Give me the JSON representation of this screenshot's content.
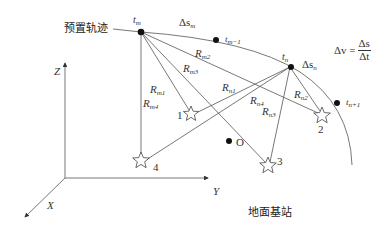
{
  "diagram": {
    "trajectory_label": "预置轨迹",
    "ground_station_label": "地面基站",
    "axes": {
      "x": "X",
      "y": "Y",
      "z": "Z"
    },
    "points": {
      "t_m": {
        "base": "t",
        "sub": "m"
      },
      "t_m_minus_1": {
        "base": "t",
        "sub": "m−1"
      },
      "t_n": {
        "base": "t",
        "sub": "n"
      },
      "t_n_plus_1": {
        "base": "t",
        "sub": "n+1"
      },
      "origin": "O"
    },
    "segments": {
      "ds_m": {
        "base": "Δs",
        "sub": "m"
      },
      "ds_n": {
        "base": "Δs",
        "sub": "n"
      }
    },
    "ranges_m": [
      {
        "base": "R",
        "sub": "m1"
      },
      {
        "base": "R",
        "sub": "m2"
      },
      {
        "base": "R",
        "sub": "m3"
      },
      {
        "base": "R",
        "sub": "m4"
      }
    ],
    "ranges_n": [
      {
        "base": "R",
        "sub": "n1"
      },
      {
        "base": "R",
        "sub": "n2"
      },
      {
        "base": "R",
        "sub": "n3"
      },
      {
        "base": "R",
        "sub": "n4"
      }
    ],
    "stations": [
      "1",
      "2",
      "3",
      "4"
    ],
    "formula": {
      "lhs": "Δv =",
      "numerator": "Δs",
      "denominator": "Δt"
    },
    "colors": {
      "line": "#555555",
      "dot": "#111111",
      "star_stroke": "#444444"
    }
  }
}
